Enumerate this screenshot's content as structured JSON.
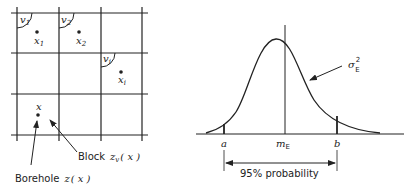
{
  "left_panel": {
    "blocks": [
      {
        "volume": "v",
        "volume_sub": "1",
        "point": "x",
        "point_sub": "1"
      },
      {
        "volume": "v",
        "volume_sub": "2",
        "point": "x",
        "point_sub": "2"
      },
      {
        "volume": "v",
        "volume_sub": "i",
        "point": "x",
        "point_sub": "i"
      }
    ],
    "borehole_point": "x",
    "block_label": "Block",
    "block_expr": "z",
    "block_expr_sub": "v",
    "block_expr_arg": "( x )",
    "borehole_label": "Borehole",
    "borehole_expr": "z",
    "borehole_expr_arg": "( x )"
  },
  "right_panel": {
    "variance_symbol": "σ",
    "variance_sup": "2",
    "variance_sub": "E",
    "lower_bound": "a",
    "mean_symbol": "m",
    "mean_sub": "E",
    "upper_bound": "b",
    "interval_label": "95% probability",
    "interval_probability": 0.95
  }
}
